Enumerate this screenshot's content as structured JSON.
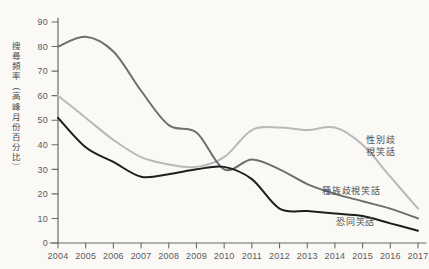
{
  "chart_data": {
    "type": "line",
    "title": "",
    "xlabel": "",
    "ylabel": "搜尋頻率（高峰月份百分比）",
    "x": [
      2004,
      2005,
      2006,
      2007,
      2008,
      2009,
      2010,
      2011,
      2012,
      2013,
      2014,
      2015,
      2016,
      2017
    ],
    "xtick_labels": [
      "2004",
      "2005",
      "2006",
      "2007",
      "2008",
      "2009",
      "2010",
      "2011",
      "2012",
      "2013",
      "2014",
      "2015",
      "2016",
      "2017"
    ],
    "ytick_labels": [
      "0",
      "10",
      "20",
      "30",
      "40",
      "50",
      "60",
      "70",
      "80",
      "90"
    ],
    "ylim": [
      0,
      90
    ],
    "ytick_step": 10,
    "grid": false,
    "legend_position": "inline-right",
    "series": [
      {
        "name": "性別歧視笑話",
        "label_text": "性別歧\n視笑話",
        "color": "#b9b9b9",
        "stroke_width": 2.0,
        "values": [
          60,
          51,
          42,
          35,
          32,
          31,
          35,
          46,
          47,
          46,
          47,
          40,
          27,
          14
        ]
      },
      {
        "name": "種族歧視笑話",
        "label_text": "種族歧視笑話",
        "color": "#6e6e6e",
        "stroke_width": 2.0,
        "values": [
          80,
          84,
          78,
          62,
          48,
          45,
          30,
          34,
          30,
          24,
          20,
          17,
          14,
          10
        ]
      },
      {
        "name": "恐同笑話",
        "label_text": "恐同笑話",
        "color": "#1e1e1e",
        "stroke_width": 2.0,
        "values": [
          51,
          39,
          33,
          27,
          28,
          30,
          31,
          26,
          14,
          13,
          12,
          11,
          8,
          5
        ]
      }
    ]
  }
}
